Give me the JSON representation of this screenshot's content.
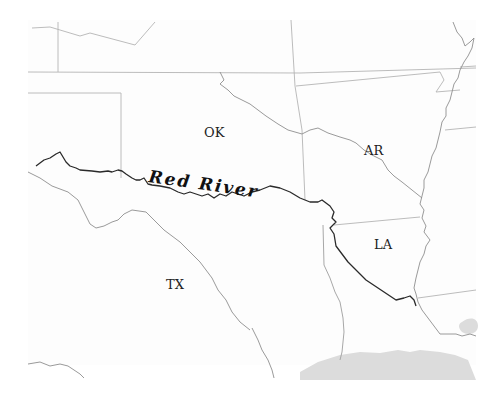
{
  "map": {
    "title": "Red River",
    "background": "#ffffff",
    "colors": {
      "border": "#b4b4b4",
      "minor_river": "#8e8e8e",
      "red_river": "#2a2a2a",
      "gulf": "#dcdcdc",
      "label": "#222222"
    },
    "states": [
      {
        "id": "OK",
        "label": "OK",
        "x": 214,
        "y": 136
      },
      {
        "id": "AR",
        "label": "AR",
        "x": 375,
        "y": 155
      },
      {
        "id": "LA",
        "label": "LA",
        "x": 381,
        "y": 247
      },
      {
        "id": "TX",
        "label": "TX",
        "x": 176,
        "y": 288
      }
    ],
    "rivers": [
      {
        "id": "red-river",
        "label": "Red River",
        "emphasis": true
      },
      {
        "id": "arkansas-river",
        "label": "",
        "emphasis": false
      },
      {
        "id": "mississippi-river",
        "label": "",
        "emphasis": false
      },
      {
        "id": "sabine-river",
        "label": "",
        "emphasis": false
      },
      {
        "id": "brazos-river",
        "label": "",
        "emphasis": false
      }
    ],
    "river_label": {
      "text": "Red River",
      "x": 148,
      "y": 182
    }
  }
}
